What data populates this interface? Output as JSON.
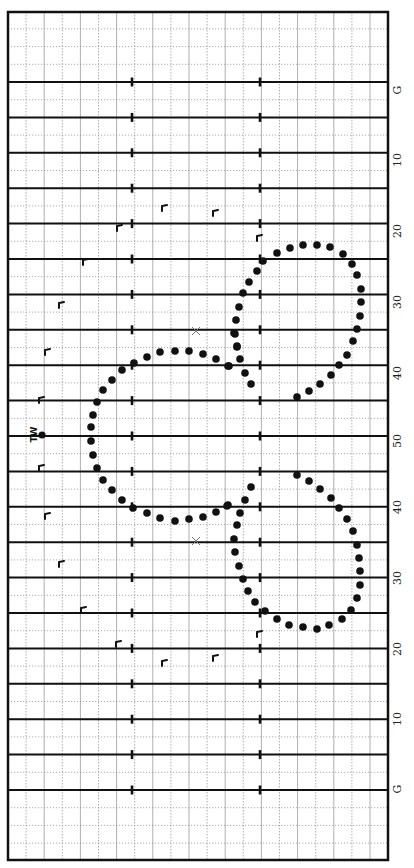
{
  "diagram": {
    "type": "marching-band drill chart on football field (rotated)",
    "field": {
      "left": 8,
      "right": 388,
      "top": 12,
      "bottom": 860,
      "yard_line_y_start": 82,
      "yard_line_spacing": 35.4,
      "yard_line_count": 21,
      "minor_grid_x_spacing": 18.1,
      "hash_x": [
        132,
        260
      ],
      "line_color": "#111111",
      "grid_color": "#9a9a9a"
    },
    "yard_labels": [
      {
        "text": "G",
        "y": 90
      },
      {
        "text": "10",
        "y": 160
      },
      {
        "text": "20",
        "y": 231
      },
      {
        "text": "30",
        "y": 302
      },
      {
        "text": "40",
        "y": 373
      },
      {
        "text": "50",
        "y": 441
      },
      {
        "text": "40",
        "y": 507
      },
      {
        "text": "30",
        "y": 578
      },
      {
        "text": "20",
        "y": 649
      },
      {
        "text": "10",
        "y": 719
      },
      {
        "text": "G",
        "y": 789
      }
    ],
    "center_marker": {
      "label": "TW",
      "x": 42,
      "y": 435
    },
    "x_markers": [
      {
        "x": 196,
        "y": 331
      },
      {
        "x": 196,
        "y": 541
      }
    ],
    "step_marks": [
      {
        "x": 165,
        "y": 208
      },
      {
        "x": 216,
        "y": 213
      },
      {
        "x": 120,
        "y": 228
      },
      {
        "x": 260,
        "y": 238
      },
      {
        "x": 86,
        "y": 262
      },
      {
        "x": 62,
        "y": 305
      },
      {
        "x": 48,
        "y": 352
      },
      {
        "x": 42,
        "y": 400
      },
      {
        "x": 42,
        "y": 468
      },
      {
        "x": 48,
        "y": 516
      },
      {
        "x": 62,
        "y": 564
      },
      {
        "x": 84,
        "y": 610
      },
      {
        "x": 119,
        "y": 644
      },
      {
        "x": 165,
        "y": 663
      },
      {
        "x": 216,
        "y": 658
      },
      {
        "x": 260,
        "y": 634
      }
    ],
    "dots": {
      "upper_right_circle": [
        [
          263,
          261
        ],
        [
          277,
          253
        ],
        [
          290,
          248
        ],
        [
          303,
          245
        ],
        [
          317,
          245
        ],
        [
          330,
          247
        ],
        [
          343,
          254
        ],
        [
          352,
          264
        ],
        [
          357,
          275
        ],
        [
          361,
          289
        ],
        [
          361,
          302
        ],
        [
          360,
          316
        ],
        [
          357,
          329
        ],
        [
          353,
          341
        ],
        [
          347,
          355
        ],
        [
          339,
          365
        ],
        [
          331,
          375
        ],
        [
          320,
          384
        ],
        [
          309,
          391
        ],
        [
          297,
          397
        ],
        [
          257,
          271
        ],
        [
          249,
          282
        ],
        [
          243,
          293
        ],
        [
          239,
          307
        ],
        [
          236,
          320
        ],
        [
          235,
          334
        ],
        [
          237,
          347
        ],
        [
          240,
          359
        ],
        [
          228,
          366
        ],
        [
          245,
          373
        ],
        [
          251,
          384
        ]
      ],
      "left_circle": [
        [
          234,
          333
        ],
        [
          237,
          346
        ],
        [
          229,
          366
        ],
        [
          216,
          359
        ],
        [
          203,
          354
        ],
        [
          189,
          351
        ],
        [
          175,
          351
        ],
        [
          160,
          352
        ],
        [
          147,
          357
        ],
        [
          134,
          363
        ],
        [
          122,
          370
        ],
        [
          112,
          380
        ],
        [
          103,
          390
        ],
        [
          97,
          402
        ],
        [
          93,
          415
        ],
        [
          91,
          427
        ],
        [
          91,
          441
        ],
        [
          93,
          455
        ],
        [
          97,
          468
        ],
        [
          103,
          480
        ],
        [
          112,
          490
        ],
        [
          122,
          500
        ],
        [
          133,
          508
        ],
        [
          147,
          513
        ],
        [
          160,
          518
        ],
        [
          175,
          521
        ],
        [
          189,
          519
        ],
        [
          203,
          517
        ],
        [
          216,
          512
        ],
        [
          228,
          505
        ]
      ],
      "lower_right_circle": [
        [
          297,
          475
        ],
        [
          309,
          481
        ],
        [
          320,
          489
        ],
        [
          331,
          498
        ],
        [
          339,
          508
        ],
        [
          347,
          519
        ],
        [
          353,
          531
        ],
        [
          357,
          545
        ],
        [
          359,
          558
        ],
        [
          360,
          571
        ],
        [
          360,
          585
        ],
        [
          357,
          598
        ],
        [
          351,
          610
        ],
        [
          342,
          619
        ],
        [
          329,
          625
        ],
        [
          317,
          629
        ],
        [
          303,
          627
        ],
        [
          289,
          625
        ],
        [
          277,
          619
        ],
        [
          265,
          611
        ],
        [
          255,
          602
        ],
        [
          248,
          591
        ],
        [
          243,
          579
        ],
        [
          239,
          566
        ],
        [
          235,
          552
        ],
        [
          234,
          539
        ],
        [
          237,
          525
        ],
        [
          240,
          513
        ],
        [
          227,
          506
        ],
        [
          245,
          500
        ],
        [
          251,
          487
        ]
      ]
    }
  }
}
